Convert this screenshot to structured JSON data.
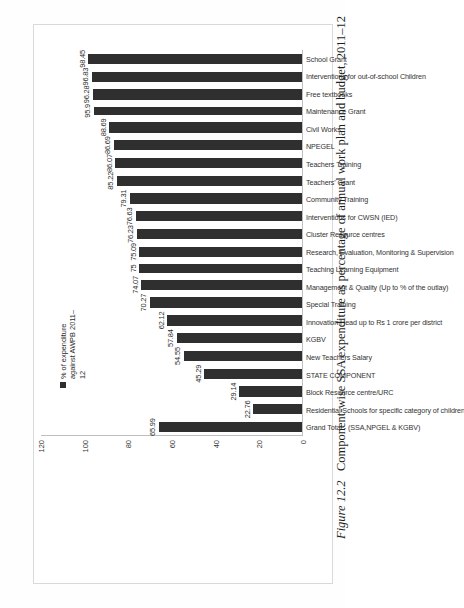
{
  "figure": {
    "caption_number": "Figure 12.2",
    "caption_text": "Component-wise SSA expenditure as percentage of annual work plan and budget, 2011–12"
  },
  "legend": {
    "entries": [
      {
        "label": "% of expenditure against AWPB 2011–12",
        "color": "#2f2f2f",
        "swatch_name": "legend-swatch"
      }
    ]
  },
  "axis": {
    "ticks": [
      "0",
      "20",
      "40",
      "60",
      "80",
      "100",
      "120"
    ]
  },
  "chart_data": {
    "type": "bar",
    "title": "Component-wise SSA expenditure as percentage of annual work plan and budget, 2011–12",
    "orientation": "horizontal",
    "xlabel": "",
    "ylabel": "",
    "ylim": [
      0,
      120
    ],
    "grid": false,
    "legend_position": "top-right",
    "series": [
      {
        "name": "% of expenditure against AWPB 2011–12",
        "color": "#2f2f2f",
        "values": [
          65.99,
          22.76,
          29.14,
          45.29,
          54.55,
          57.84,
          62.12,
          70.27,
          74.07,
          75,
          75.09,
          76.23,
          76.63,
          79.31,
          85.22,
          86.07,
          86.69,
          88.69,
          95.9,
          96.28,
          96.83,
          98.45
        ]
      }
    ],
    "categories": [
      "Grand Total - (SSA,NPGEL & KGBV)",
      "Residential Schools for specific category of children",
      "Block Resource centre/URC",
      "STATE COMPONENT",
      "New Teachers Salary",
      "KGBV",
      "Innovation Head up to Rs 1 crore per district",
      "Special Training",
      "Management & Quality (Up to % of the outlay)",
      "Teaching Learning Equipment",
      "Research, Evaluation, Monitoring & Supervision",
      "Cluster Resource centres",
      "Interventions for CWSN (IED)",
      "Community Training",
      "Teachers' Grant",
      "Teachers Training",
      "NPEGEL",
      "Civil Works",
      "Maintenance Grant",
      "Free textbooks",
      "Interventions for out-of-school Children",
      "School Grant"
    ],
    "value_labels": [
      "65.99",
      "22.76",
      "29.14",
      "45.29",
      "54.55",
      "57.84",
      "62.12",
      "70.27",
      "74.07",
      "75",
      "75.09",
      "76.23",
      "76.63",
      "79.31",
      "85.22",
      "86.07",
      "86.69",
      "88.69",
      "95.9",
      "96.28",
      "96.83",
      "98.45"
    ]
  }
}
